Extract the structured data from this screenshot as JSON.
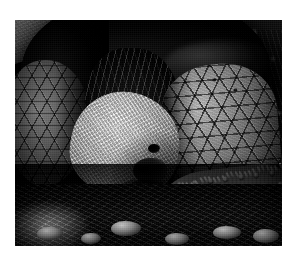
{
  "page": {
    "background_color": "#ffffff",
    "width": 293,
    "height": 267
  },
  "photo": {
    "alt": "Galapagos giant tortoise feeding on a prickly pear cactus pad",
    "color_mode": "grayscale",
    "frame": {
      "x": 15,
      "y": 20,
      "width": 267,
      "height": 226
    },
    "palette": {
      "black": "#050505",
      "shadow": "#141414",
      "midtone": "#6b6b6b",
      "highlight": "#d2d2d2",
      "white": "#ededed"
    },
    "subjects": [
      {
        "name": "carapace",
        "label": "dark domed shell"
      },
      {
        "name": "head",
        "label": "tortoise head"
      },
      {
        "name": "neck",
        "label": "wrinkled neck skin"
      },
      {
        "name": "right-foreleg",
        "label": "scaled foreleg"
      },
      {
        "name": "left-foreleg",
        "label": "scaled limb"
      },
      {
        "name": "cactus-pad",
        "label": "prickly pear pad"
      },
      {
        "name": "ground",
        "label": "volcanic rocky ground"
      },
      {
        "name": "foliage",
        "label": "background brush"
      }
    ],
    "caption": ""
  }
}
